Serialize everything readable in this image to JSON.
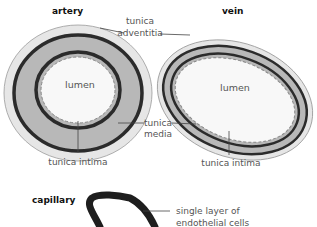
{
  "titles": {
    "artery": "artery",
    "vein": "vein",
    "capillary": "capillary"
  },
  "labels": {
    "adventitia_line1": "tunica",
    "adventitia_line2": "adventitia",
    "media_line1": "tunica",
    "media_line2": "media",
    "intima_artery": "tunica intima",
    "intima_vein": "tunica intima",
    "lumen_artery": "lumen",
    "lumen_vein": "lumen",
    "capillary_line1": "single layer of",
    "capillary_line2": "endothelial cells"
  },
  "colors": {
    "adventitia": "#e6e6e6",
    "media": "#b8b8b8",
    "elastic_band": "#2b2b2b",
    "lumen": "#f8f8f8",
    "leader": "#444444"
  }
}
